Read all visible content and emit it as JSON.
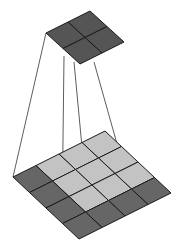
{
  "diagram": {
    "output_grid": {
      "rows": 2,
      "cols": 2,
      "color": "#555555"
    },
    "input_grid": {
      "rows": 4,
      "cols": 4,
      "light_color": "#c3c3c3",
      "dark_color": "#666666",
      "highlighted_region": "3x3 light cells (receptive field)"
    },
    "line_color": "#333333",
    "stroke_color": "#1a1a1a"
  }
}
